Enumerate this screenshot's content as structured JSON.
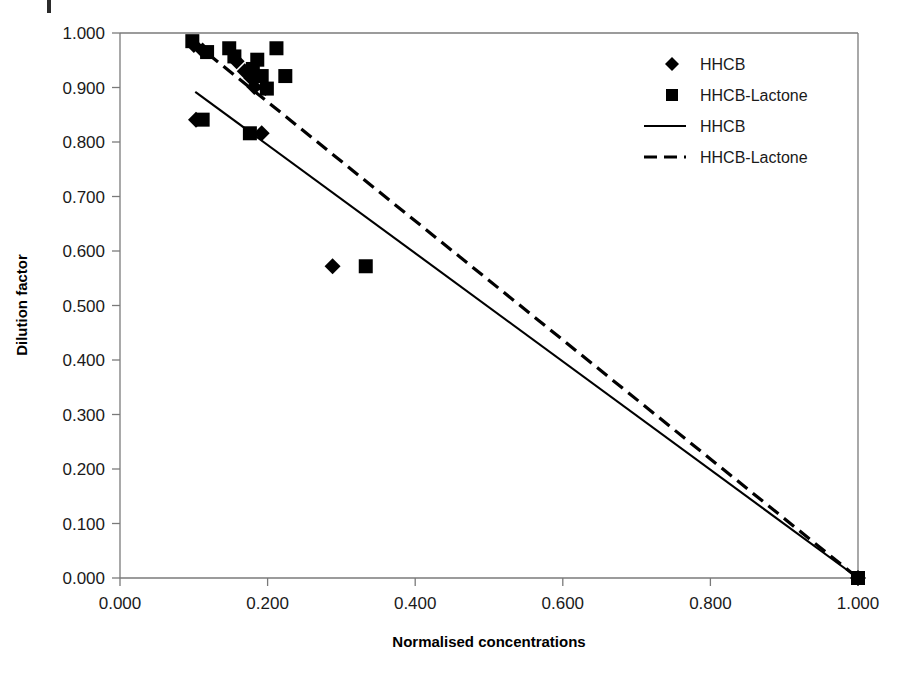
{
  "chart_data": {
    "type": "scatter",
    "title": "",
    "xlabel": "Normalised concentrations",
    "ylabel": "Dilution factor",
    "xlim": [
      0.0,
      1.0
    ],
    "ylim": [
      0.0,
      1.0
    ],
    "grid": false,
    "legend_position": "top-right",
    "x_ticks": [
      "0.000",
      "0.200",
      "0.400",
      "0.600",
      "0.800",
      "1.000"
    ],
    "x_tick_values": [
      0.0,
      0.2,
      0.4,
      0.6,
      0.8,
      1.0
    ],
    "y_ticks": [
      "0.000",
      "0.100",
      "0.200",
      "0.300",
      "0.400",
      "0.500",
      "0.600",
      "0.700",
      "0.800",
      "0.900",
      "1.000"
    ],
    "y_tick_values": [
      0.0,
      0.1,
      0.2,
      0.3,
      0.4,
      0.5,
      0.6,
      0.7,
      0.8,
      0.9,
      1.0
    ],
    "series": [
      {
        "name": "HHCB",
        "kind": "scatter",
        "marker": "diamond",
        "color": "#000000",
        "points": [
          {
            "x": 0.1,
            "y": 0.978
          },
          {
            "x": 0.112,
            "y": 0.968
          },
          {
            "x": 0.158,
            "y": 0.948
          },
          {
            "x": 0.169,
            "y": 0.93
          },
          {
            "x": 0.178,
            "y": 0.917
          },
          {
            "x": 0.182,
            "y": 0.901
          },
          {
            "x": 0.197,
            "y": 0.899
          },
          {
            "x": 0.103,
            "y": 0.841
          },
          {
            "x": 0.192,
            "y": 0.816
          },
          {
            "x": 0.288,
            "y": 0.572
          },
          {
            "x": 1.0,
            "y": 0.0
          }
        ]
      },
      {
        "name": "HHCB-Lactone",
        "kind": "scatter",
        "marker": "square",
        "color": "#000000",
        "points": [
          {
            "x": 0.098,
            "y": 0.985
          },
          {
            "x": 0.118,
            "y": 0.965
          },
          {
            "x": 0.148,
            "y": 0.972
          },
          {
            "x": 0.155,
            "y": 0.957
          },
          {
            "x": 0.186,
            "y": 0.951
          },
          {
            "x": 0.18,
            "y": 0.934
          },
          {
            "x": 0.192,
            "y": 0.921
          },
          {
            "x": 0.199,
            "y": 0.898
          },
          {
            "x": 0.212,
            "y": 0.972
          },
          {
            "x": 0.224,
            "y": 0.921
          },
          {
            "x": 0.112,
            "y": 0.841
          },
          {
            "x": 0.176,
            "y": 0.816
          },
          {
            "x": 0.333,
            "y": 0.572
          },
          {
            "x": 1.0,
            "y": 0.0
          }
        ]
      },
      {
        "name": "HHCB",
        "kind": "line",
        "style": "solid",
        "color": "#000000",
        "points": [
          {
            "x": 0.102,
            "y": 0.892
          },
          {
            "x": 1.0,
            "y": 0.0
          }
        ]
      },
      {
        "name": "HHCB-Lactone",
        "kind": "line",
        "style": "dashed",
        "color": "#000000",
        "points": [
          {
            "x": 0.098,
            "y": 0.985
          },
          {
            "x": 1.0,
            "y": 0.0
          }
        ]
      }
    ]
  },
  "legend": {
    "entries": [
      {
        "label": "HHCB",
        "symbol": "diamond"
      },
      {
        "label": "HHCB-Lactone",
        "symbol": "square"
      },
      {
        "label": "HHCB",
        "symbol": "solid-line"
      },
      {
        "label": "HHCB-Lactone",
        "symbol": "dashed-line"
      }
    ]
  },
  "axes": {
    "x_title": "Normalised concentrations",
    "y_title": "Dilution factor"
  }
}
